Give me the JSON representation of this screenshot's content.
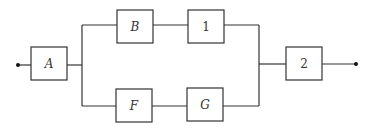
{
  "diagram": {
    "type": "reliability block diagram",
    "blocks": [
      {
        "id": "A",
        "label": "A",
        "italic": true
      },
      {
        "id": "B",
        "label": "B",
        "italic": true
      },
      {
        "id": "1",
        "label": "1",
        "italic": false
      },
      {
        "id": "F",
        "label": "F",
        "italic": true
      },
      {
        "id": "G",
        "label": "G",
        "italic": true
      },
      {
        "id": "2",
        "label": "2",
        "italic": false
      }
    ],
    "connections": [
      {
        "from": "input",
        "to": "A"
      },
      {
        "from": "A",
        "to": "B"
      },
      {
        "from": "B",
        "to": "1"
      },
      {
        "from": "A",
        "to": "F"
      },
      {
        "from": "F",
        "to": "G"
      },
      {
        "from": "1",
        "to": "2"
      },
      {
        "from": "G",
        "to": "2"
      },
      {
        "from": "2",
        "to": "output"
      }
    ],
    "colors": {
      "line": "#333333",
      "background": "#ffffff"
    }
  }
}
